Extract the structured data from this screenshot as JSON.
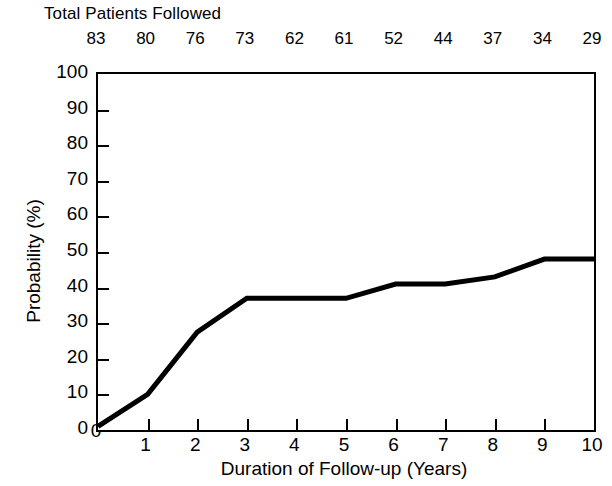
{
  "chart_data": {
    "type": "line",
    "title": "",
    "xlabel": "Duration of Follow-up (Years)",
    "ylabel": "Probability (%)",
    "xlim": [
      0,
      10
    ],
    "ylim": [
      0,
      100
    ],
    "grid": false,
    "legend": null,
    "x_ticks": [
      "0",
      "1",
      "2",
      "3",
      "4",
      "5",
      "6",
      "7",
      "8",
      "9",
      "10"
    ],
    "x_tick_values": [
      0,
      1,
      2,
      3,
      4,
      5,
      6,
      7,
      8,
      9,
      10
    ],
    "y_ticks": [
      "0",
      "10",
      "20",
      "30",
      "40",
      "50",
      "60",
      "70",
      "80",
      "90",
      "100"
    ],
    "y_tick_values": [
      0,
      10,
      20,
      30,
      40,
      50,
      60,
      70,
      80,
      90,
      100
    ],
    "secondary_axis": {
      "position": "top",
      "label": "Total Patients Followed",
      "tick_labels": [
        "83",
        "80",
        "76",
        "73",
        "62",
        "61",
        "52",
        "44",
        "37",
        "34",
        "29"
      ],
      "tick_values": [
        83,
        80,
        76,
        73,
        62,
        61,
        52,
        44,
        37,
        34,
        29
      ],
      "at_x": [
        0,
        1,
        2,
        3,
        4,
        5,
        6,
        7,
        8,
        9,
        10
      ]
    },
    "series": [
      {
        "name": "Cumulative probability",
        "color": "#000000",
        "line_width": 4,
        "x": [
          0,
          1,
          2,
          3,
          4,
          5,
          6,
          7,
          8,
          9,
          10
        ],
        "values": [
          1,
          10,
          27.5,
          37,
          37,
          37,
          41,
          41,
          43,
          48,
          48
        ]
      }
    ]
  },
  "axes": {
    "top_axis_title": "Total Patients Followed",
    "y_axis_title": "Probability (%)",
    "x_axis_title": "Duration of Follow-up (Years)"
  }
}
